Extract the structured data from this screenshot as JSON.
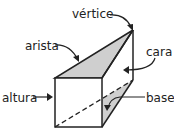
{
  "diagram": {
    "labels": {
      "vertex": "vértice",
      "edge": "arista",
      "face": "cara",
      "height": "altura",
      "base": "base"
    },
    "colors": {
      "stroke": "#222222",
      "shade": "#cfcfcf"
    }
  }
}
